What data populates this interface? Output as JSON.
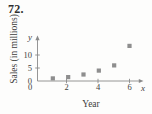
{
  "problem": {
    "number": "72."
  },
  "chart_data": {
    "type": "scatter",
    "title": "",
    "xlabel": "Year",
    "ylabel": "Sales (in millions)",
    "x_axis_variable": "x",
    "y_axis_variable": "y",
    "x": [
      1,
      2,
      3,
      4,
      5,
      6
    ],
    "values": [
      1,
      1.5,
      2.5,
      4,
      6,
      13.5
    ],
    "points": [
      {
        "x": 1,
        "y": 1
      },
      {
        "x": 2,
        "y": 1.5
      },
      {
        "x": 3,
        "y": 2.5
      },
      {
        "x": 4,
        "y": 4
      },
      {
        "x": 5,
        "y": 6
      },
      {
        "x": 6,
        "y": 13.5
      }
    ],
    "xlim": [
      0,
      6.8
    ],
    "ylim": [
      0,
      15.5
    ],
    "x_ticks": [
      0,
      2,
      4,
      6
    ],
    "x_tick_labels": [
      "0",
      "2",
      "4",
      "6"
    ],
    "y_ticks": [
      0,
      5,
      10
    ],
    "y_tick_labels": [
      "0",
      "5",
      "10"
    ],
    "grid": false,
    "legend": null,
    "marker": "square",
    "marker_color": "#8e8e8e",
    "axis_color": "#8a8a8a",
    "origin_label": "0"
  },
  "axes": {
    "y_tick_labels": [
      "10",
      "5"
    ],
    "x_tick_labels": [
      "2",
      "4",
      "6"
    ]
  }
}
